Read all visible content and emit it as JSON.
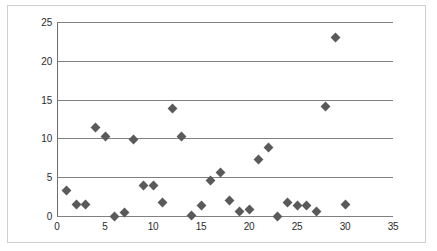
{
  "chart_data": {
    "type": "scatter",
    "title": "",
    "subtitle": "",
    "xlabel": "",
    "ylabel": "",
    "xlim": [
      0,
      35
    ],
    "ylim": [
      0,
      25
    ],
    "xticks": [
      0,
      5,
      10,
      15,
      20,
      25,
      30,
      35
    ],
    "yticks": [
      0,
      5,
      10,
      15,
      20,
      25
    ],
    "grid": "horizontal",
    "legend": "none",
    "marker": "diamond",
    "marker_color": "#5a5a5a",
    "gridline_color": "#808080",
    "axis_color": "#6e6e6e",
    "frame_color": "#cfcfcf",
    "series": [
      {
        "name": "series-1",
        "points": [
          {
            "x": 1,
            "y": 3.3
          },
          {
            "x": 2,
            "y": 1.5
          },
          {
            "x": 3,
            "y": 1.5
          },
          {
            "x": 4,
            "y": 11.4
          },
          {
            "x": 5,
            "y": 10.3
          },
          {
            "x": 6,
            "y": 0.0
          },
          {
            "x": 7,
            "y": 0.5
          },
          {
            "x": 8,
            "y": 9.8
          },
          {
            "x": 9,
            "y": 3.9
          },
          {
            "x": 10,
            "y": 3.9
          },
          {
            "x": 11,
            "y": 1.7
          },
          {
            "x": 12,
            "y": 13.9
          },
          {
            "x": 13,
            "y": 10.3
          },
          {
            "x": 14,
            "y": 0.1
          },
          {
            "x": 15,
            "y": 1.4
          },
          {
            "x": 16,
            "y": 4.6
          },
          {
            "x": 17,
            "y": 5.6
          },
          {
            "x": 18,
            "y": 2.0
          },
          {
            "x": 19,
            "y": 0.6
          },
          {
            "x": 20,
            "y": 0.8
          },
          {
            "x": 21,
            "y": 7.3
          },
          {
            "x": 22,
            "y": 8.8
          },
          {
            "x": 23,
            "y": 0.0
          },
          {
            "x": 24,
            "y": 1.8
          },
          {
            "x": 25,
            "y": 1.3
          },
          {
            "x": 26,
            "y": 1.3
          },
          {
            "x": 27,
            "y": 0.6
          },
          {
            "x": 28,
            "y": 14.1
          },
          {
            "x": 29,
            "y": 23.0
          },
          {
            "x": 30,
            "y": 1.5
          }
        ]
      }
    ]
  }
}
